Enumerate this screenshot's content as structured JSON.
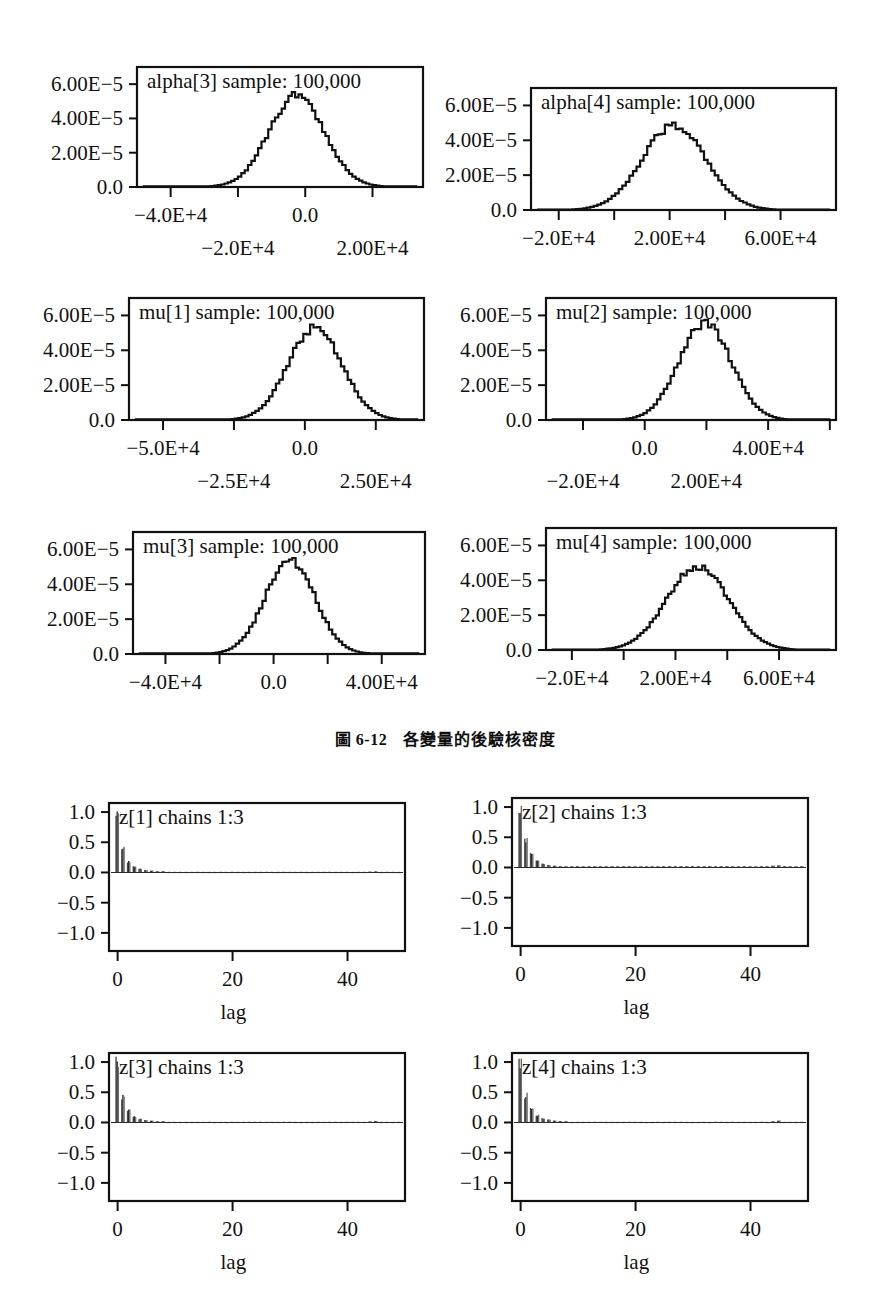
{
  "figure": {
    "caption_number": "圖 6-12",
    "caption_text": "各變量的後驗核密度"
  },
  "chart_data": [
    {
      "id": "alpha3",
      "type": "line",
      "title": "alpha[3] sample: 100,000",
      "xlabel": "",
      "ylabel": "",
      "ylim": [
        0,
        7e-05
      ],
      "xlim": [
        -50000,
        35000
      ],
      "ytick_values": [
        0.0,
        2e-05,
        4e-05,
        6e-05
      ],
      "ytick_labels": [
        "0.0",
        "2.00E-5",
        "4.00E-5",
        "6.00E-5"
      ],
      "xtick_values": [
        -40000,
        -20000,
        0,
        20000,
        40000
      ],
      "xtick_labels": [
        "-4.0E+4",
        "-2.0E+4",
        "0.0",
        "2.00E+4",
        ""
      ],
      "xtick_label_rows": [
        0,
        1,
        0,
        1,
        0
      ],
      "density": {
        "mean": -3000,
        "sd": 8200,
        "peak": 5.35e-05,
        "start": -46000,
        "end": 32000
      }
    },
    {
      "id": "alpha4",
      "type": "line",
      "title": "alpha[4] sample: 100,000",
      "xlabel": "",
      "ylabel": "",
      "ylim": [
        0,
        7e-05
      ],
      "xlim": [
        -30000,
        80000
      ],
      "ytick_values": [
        0.0,
        2e-05,
        4e-05,
        6e-05
      ],
      "ytick_labels": [
        "0.0",
        "2.00E-5",
        "4.00E-5",
        "6.00E-5"
      ],
      "xtick_values": [
        -20000,
        0,
        20000,
        40000,
        60000
      ],
      "xtick_labels": [
        "-2.0E+4",
        "",
        "2.00E+4",
        "",
        "6.00E+4"
      ],
      "xtick_label_rows": [
        0,
        0,
        0,
        0,
        0
      ],
      "density": {
        "mean": 21000,
        "sd": 11500,
        "peak": 4.85e-05,
        "start": -24000,
        "end": 76000
      }
    },
    {
      "id": "mu1",
      "type": "line",
      "title": "mu[1] sample: 100,000",
      "xlabel": "",
      "ylabel": "",
      "ylim": [
        0,
        7e-05
      ],
      "xlim": [
        -62000,
        42000
      ],
      "ytick_values": [
        0.0,
        2e-05,
        4e-05,
        6e-05
      ],
      "ytick_labels": [
        "0.0",
        "2.00E-5",
        "4.00E-5",
        "6.00E-5"
      ],
      "xtick_values": [
        -50000,
        -25000,
        0,
        25000,
        50000
      ],
      "xtick_labels": [
        "-5.0E+4",
        "-2.5E+4",
        "0.0",
        "2.50E+4",
        ""
      ],
      "xtick_label_rows": [
        0,
        1,
        0,
        1,
        0
      ],
      "density": {
        "mean": 3000,
        "sd": 9500,
        "peak": 5.3e-05,
        "start": -56000,
        "end": 38000
      }
    },
    {
      "id": "mu2",
      "type": "line",
      "title": "mu[2] sample: 100,000",
      "xlabel": "",
      "ylabel": "",
      "ylim": [
        0,
        7e-05
      ],
      "xlim": [
        -32000,
        62000
      ],
      "ytick_values": [
        0.0,
        2e-05,
        4e-05,
        6e-05
      ],
      "ytick_labels": [
        "0.0",
        "2.00E-5",
        "4.00E-5",
        "6.00E-5"
      ],
      "xtick_values": [
        -20000,
        0,
        20000,
        40000,
        60000
      ],
      "xtick_labels": [
        "-2.0E+4",
        "0.0",
        "2.00E+4",
        "4.00E+4",
        ""
      ],
      "xtick_label_rows": [
        1,
        0,
        1,
        0,
        0
      ],
      "density": {
        "mean": 19000,
        "sd": 8500,
        "peak": 5.55e-05,
        "start": -28000,
        "end": 58000
      }
    },
    {
      "id": "mu3",
      "type": "line",
      "title": "mu[3] sample: 100,000",
      "xlabel": "",
      "ylabel": "",
      "ylim": [
        0,
        7e-05
      ],
      "xlim": [
        -52000,
        56000
      ],
      "ytick_values": [
        0.0,
        2e-05,
        4e-05,
        6e-05
      ],
      "ytick_labels": [
        "0.0",
        "2.00E-5",
        "4.00E-5",
        "6.00E-5"
      ],
      "xtick_values": [
        -40000,
        -20000,
        0,
        20000,
        40000
      ],
      "xtick_labels": [
        "-4.0E+4",
        "",
        "0.0",
        "",
        "4.00E+4"
      ],
      "xtick_label_rows": [
        0,
        0,
        0,
        0,
        0
      ],
      "density": {
        "mean": 5500,
        "sd": 9200,
        "peak": 5.4e-05,
        "start": -46000,
        "end": 50000
      }
    },
    {
      "id": "mu4",
      "type": "line",
      "title": "mu[4] sample: 100,000",
      "xlabel": "",
      "ylabel": "",
      "ylim": [
        0,
        7e-05
      ],
      "xlim": [
        -30000,
        82000
      ],
      "ytick_values": [
        0.0,
        2e-05,
        4e-05,
        6e-05
      ],
      "ytick_labels": [
        "0.0",
        "2.00E-5",
        "4.00E-5",
        "6.00E-5"
      ],
      "xtick_values": [
        -20000,
        0,
        20000,
        40000,
        60000
      ],
      "xtick_labels": [
        "-2.0E+4",
        "",
        "2.00E+4",
        "",
        "6.00E+4"
      ],
      "xtick_label_rows": [
        0,
        0,
        0,
        0,
        0
      ],
      "density": {
        "mean": 28000,
        "sd": 12000,
        "peak": 4.75e-05,
        "start": -15000,
        "end": 78000
      }
    },
    {
      "id": "z1",
      "type": "bar",
      "title": "z[1] chains 1:3",
      "xlabel": "lag",
      "ylabel": "",
      "ylim": [
        -1.3,
        1.15
      ],
      "xlim": [
        -1.5,
        50
      ],
      "ytick_values": [
        -1.0,
        -0.5,
        0.0,
        0.5,
        1.0
      ],
      "ytick_labels": [
        "-1.0",
        "-0.5",
        "0.0",
        "0.5",
        "1.0"
      ],
      "xtick_values": [
        0,
        20,
        40
      ],
      "xtick_labels": [
        "0",
        "20",
        "40"
      ],
      "categories": [
        0,
        1,
        2,
        3,
        4,
        5,
        6,
        7,
        8,
        9,
        10,
        11,
        12,
        13,
        14,
        15,
        16,
        17,
        18,
        19,
        20,
        21,
        22,
        23,
        24,
        25,
        26,
        27,
        28,
        29,
        30,
        31,
        32,
        33,
        34,
        35,
        36,
        37,
        38,
        39,
        40,
        41,
        42,
        43,
        44,
        45,
        46,
        47,
        48,
        49
      ],
      "values": [
        1.0,
        0.4,
        0.18,
        0.1,
        0.06,
        0.04,
        0.03,
        0.02,
        0.02,
        0.01,
        0.01,
        0.01,
        0.01,
        0.01,
        0.01,
        0.01,
        0.01,
        0.01,
        0.01,
        0.01,
        0.01,
        0.01,
        0.01,
        0.01,
        0.01,
        0.01,
        0.01,
        0.01,
        0.01,
        0.01,
        0.01,
        0.01,
        0.01,
        0.01,
        0.01,
        0.01,
        0.01,
        0.01,
        0.01,
        0.01,
        0.01,
        0.01,
        0.01,
        0.01,
        0.015,
        0.02,
        0.01,
        0.01,
        0.01,
        0.01
      ]
    },
    {
      "id": "z2",
      "type": "bar",
      "title": "z[2] chains 1:3",
      "xlabel": "lag",
      "ylabel": "",
      "ylim": [
        -1.3,
        1.15
      ],
      "xlim": [
        -1.5,
        50
      ],
      "ytick_values": [
        -1.0,
        -0.5,
        0.0,
        0.5,
        1.0
      ],
      "ytick_labels": [
        "-1.0",
        "-0.5",
        "0.0",
        "0.5",
        "1.0"
      ],
      "xtick_values": [
        0,
        20,
        40
      ],
      "xtick_labels": [
        "0",
        "20",
        "40"
      ],
      "categories": [
        0,
        1,
        2,
        3,
        4,
        5,
        6,
        7,
        8,
        9,
        10,
        11,
        12,
        13,
        14,
        15,
        16,
        17,
        18,
        19,
        20,
        21,
        22,
        23,
        24,
        25,
        26,
        27,
        28,
        29,
        30,
        31,
        32,
        33,
        34,
        35,
        36,
        37,
        38,
        39,
        40,
        41,
        42,
        43,
        44,
        45,
        46,
        47,
        48,
        49
      ],
      "values": [
        1.0,
        0.47,
        0.23,
        0.11,
        0.06,
        0.04,
        0.03,
        0.02,
        0.02,
        0.02,
        0.02,
        0.02,
        0.02,
        0.02,
        0.02,
        0.02,
        0.02,
        0.02,
        0.02,
        0.02,
        0.02,
        0.02,
        0.02,
        0.02,
        0.02,
        0.02,
        0.02,
        0.02,
        0.02,
        0.02,
        0.02,
        0.02,
        0.02,
        0.02,
        0.02,
        0.02,
        0.02,
        0.02,
        0.02,
        0.02,
        0.02,
        0.02,
        0.02,
        0.02,
        0.03,
        0.035,
        0.02,
        0.02,
        0.02,
        0.02
      ]
    },
    {
      "id": "z3",
      "type": "bar",
      "title": "z[3] chains 1:3",
      "xlabel": "lag",
      "ylabel": "",
      "ylim": [
        -1.3,
        1.15
      ],
      "xlim": [
        -1.5,
        50
      ],
      "ytick_values": [
        -1.0,
        -0.5,
        0.0,
        0.5,
        1.0
      ],
      "ytick_labels": [
        "-1.0",
        "-0.5",
        "0.0",
        "0.5",
        "1.0"
      ],
      "xtick_values": [
        0,
        20,
        40
      ],
      "xtick_labels": [
        "0",
        "20",
        "40"
      ],
      "categories": [
        0,
        1,
        2,
        3,
        4,
        5,
        6,
        7,
        8,
        9,
        10,
        11,
        12,
        13,
        14,
        15,
        16,
        17,
        18,
        19,
        20,
        21,
        22,
        23,
        24,
        25,
        26,
        27,
        28,
        29,
        30,
        31,
        32,
        33,
        34,
        35,
        36,
        37,
        38,
        39,
        40,
        41,
        42,
        43,
        44,
        45,
        46,
        47,
        48,
        49
      ],
      "values": [
        1.0,
        0.42,
        0.2,
        0.1,
        0.06,
        0.04,
        0.03,
        0.02,
        0.02,
        0.01,
        0.01,
        0.01,
        0.01,
        0.01,
        0.01,
        0.01,
        0.01,
        0.01,
        0.01,
        0.01,
        0.01,
        0.01,
        0.01,
        0.01,
        0.01,
        0.01,
        0.01,
        0.01,
        0.01,
        0.01,
        0.01,
        0.01,
        0.01,
        0.01,
        0.01,
        0.01,
        0.01,
        0.01,
        0.01,
        0.01,
        0.01,
        0.01,
        0.01,
        0.01,
        0.02,
        0.025,
        0.01,
        0.01,
        0.01,
        0.01
      ]
    },
    {
      "id": "z4",
      "type": "bar",
      "title": "z[4] chains 1:3",
      "xlabel": "lag",
      "ylabel": "",
      "ylim": [
        -1.3,
        1.15
      ],
      "xlim": [
        -1.5,
        50
      ],
      "ytick_values": [
        -1.0,
        -0.5,
        0.0,
        0.5,
        1.0
      ],
      "ytick_labels": [
        "-1.0",
        "-0.5",
        "0.0",
        "0.5",
        "1.0"
      ],
      "xtick_values": [
        0,
        20,
        40
      ],
      "xtick_labels": [
        "0",
        "20",
        "40"
      ],
      "categories": [
        0,
        1,
        2,
        3,
        4,
        5,
        6,
        7,
        8,
        9,
        10,
        11,
        12,
        13,
        14,
        15,
        16,
        17,
        18,
        19,
        20,
        21,
        22,
        23,
        24,
        25,
        26,
        27,
        28,
        29,
        30,
        31,
        32,
        33,
        34,
        35,
        36,
        37,
        38,
        39,
        40,
        41,
        42,
        43,
        44,
        45,
        46,
        47,
        48,
        49
      ],
      "values": [
        1.0,
        0.45,
        0.22,
        0.12,
        0.07,
        0.05,
        0.03,
        0.02,
        0.02,
        0.01,
        0.01,
        0.01,
        0.01,
        0.01,
        0.01,
        0.01,
        0.01,
        0.01,
        0.01,
        0.01,
        0.01,
        0.01,
        0.01,
        0.01,
        0.01,
        0.01,
        0.01,
        0.01,
        0.01,
        0.01,
        0.01,
        0.01,
        0.01,
        0.01,
        0.01,
        0.01,
        0.01,
        0.01,
        0.01,
        0.01,
        0.01,
        0.01,
        0.01,
        0.01,
        0.02,
        0.03,
        0.01,
        0.01,
        0.01,
        0.01
      ]
    }
  ],
  "layout": {
    "panels": [
      {
        "id": "alpha3",
        "left": 137,
        "top": 67,
        "w": 286,
        "h": 120,
        "kind": "density",
        "ylab_x": -8
      },
      {
        "id": "alpha4",
        "left": 531,
        "top": 88,
        "w": 305,
        "h": 122,
        "kind": "density",
        "ylab_x": -8
      },
      {
        "id": "mu1",
        "left": 129,
        "top": 298,
        "w": 295,
        "h": 122,
        "kind": "density",
        "ylab_x": -8
      },
      {
        "id": "mu2",
        "left": 546,
        "top": 298,
        "w": 290,
        "h": 122,
        "kind": "density",
        "ylab_x": -8
      },
      {
        "id": "mu3",
        "left": 133,
        "top": 532,
        "w": 292,
        "h": 122,
        "kind": "density",
        "ylab_x": -8
      },
      {
        "id": "mu4",
        "left": 546,
        "top": 528,
        "w": 290,
        "h": 122,
        "kind": "density",
        "ylab_x": -8
      },
      {
        "id": "z1",
        "left": 109,
        "top": 803,
        "w": 296,
        "h": 148,
        "kind": "acf",
        "ylab_x": -8
      },
      {
        "id": "z2",
        "left": 512,
        "top": 798,
        "w": 296,
        "h": 148,
        "kind": "acf",
        "ylab_x": -8
      },
      {
        "id": "z3",
        "left": 109,
        "top": 1053,
        "w": 296,
        "h": 148,
        "kind": "acf",
        "ylab_x": -8
      },
      {
        "id": "z4",
        "left": 512,
        "top": 1053,
        "w": 296,
        "h": 148,
        "kind": "acf",
        "ylab_x": -8
      }
    ],
    "caption_top": 726
  }
}
